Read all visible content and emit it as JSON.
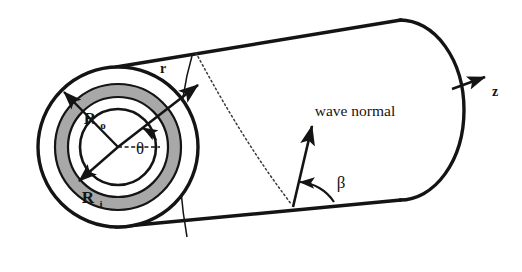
{
  "figure": {
    "background_color": "#ffffff",
    "line_color": "#141414",
    "annulus_fill": "#a8a8a8",
    "shell_fill": "#ffffff"
  },
  "labels": {
    "outer_radius": "R",
    "outer_radius_sub": "o",
    "inner_radius": "R",
    "inner_radius_sub": "i",
    "radial_coord": "r",
    "circumferential_angle": "θ",
    "helical_angle": "β",
    "axial_axis": "z",
    "wave_normal": "wave normal"
  },
  "geometry": {
    "cross_section_center": {
      "x": 118,
      "y": 147
    },
    "radii": {
      "outer_wall": 80,
      "annulus_outer": 63,
      "annulus_inner": 50,
      "inner_bore": 38
    },
    "cylinder_axis_angle_deg": -25,
    "cylinder_length": 330,
    "end_cap_center": {
      "x": 430,
      "y": 110
    },
    "theta_value_deg": 38,
    "beta_value_deg": 62
  },
  "elements": {
    "annulus_ring": "shaded-wall-ring",
    "helical_wave_path": "dotted-helix-curve",
    "wave_normal_vector": "arrow-up-right",
    "z_axis_vector": "arrow-right",
    "r_vector": "arrow-outward",
    "theta_reference": "horizontal-dashed-line"
  }
}
